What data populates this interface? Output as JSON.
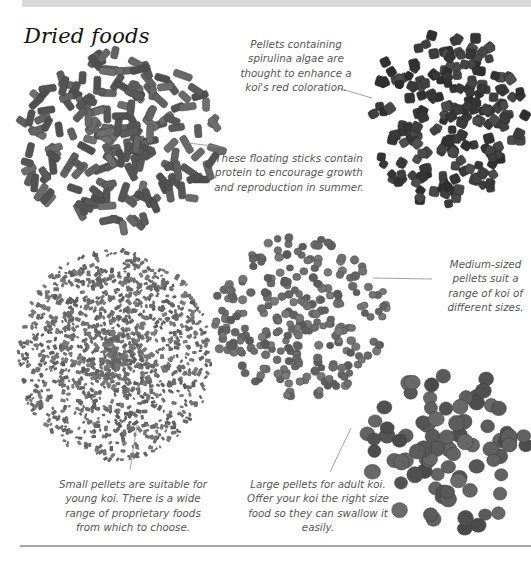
{
  "page": {
    "title": "Dried foods"
  },
  "captions": [
    {
      "id": "spirulina",
      "text": "Pellets containing spirulina algae are thought to enhance a koi's red coloration.",
      "x": 230,
      "y": 37,
      "w": 132
    },
    {
      "id": "sticks",
      "text": "These floating sticks contain protein to encourage growth and reproduction in summer.",
      "x": 214,
      "y": 151,
      "w": 150
    },
    {
      "id": "medium",
      "text": "Medium-sized pellets suit a range of koi of different sizes.",
      "x": 438,
      "y": 257,
      "w": 95
    },
    {
      "id": "small",
      "text": "Small pellets are suitable for young koi. There is a wide range of proprietary foods from which to choose.",
      "x": 54,
      "y": 477,
      "w": 158
    },
    {
      "id": "large",
      "text": "Large pellets for adult koi. Offer your koi the right size food so they can swallow it easily.",
      "x": 244,
      "y": 477,
      "w": 148
    }
  ],
  "piles": [
    {
      "id": "floating-sticks",
      "label": "Floating sticks",
      "shape": "stick",
      "cx": 118,
      "cy": 140,
      "rx": 100,
      "ry": 88,
      "count": 190,
      "size": 16,
      "thick": 7,
      "color": "#5f5f5f",
      "seed": 3
    },
    {
      "id": "spirulina-pellets",
      "label": "Spirulina pellets",
      "shape": "cube",
      "cx": 447,
      "cy": 118,
      "rx": 80,
      "ry": 88,
      "count": 210,
      "size": 9,
      "color": "#3e3e3e",
      "seed": 11
    },
    {
      "id": "medium-pellets",
      "label": "Medium pellets",
      "shape": "round",
      "cx": 300,
      "cy": 318,
      "rx": 88,
      "ry": 82,
      "count": 260,
      "size": 8,
      "color": "#6a6a6a",
      "seed": 21
    },
    {
      "id": "small-pellets",
      "label": "Small pellets",
      "shape": "tiny",
      "cx": 115,
      "cy": 355,
      "rx": 98,
      "ry": 105,
      "count": 1300,
      "size": 5,
      "color": "#6c6c6c",
      "seed": 41
    },
    {
      "id": "large-pellets",
      "label": "Large pellets",
      "shape": "disc",
      "cx": 447,
      "cy": 450,
      "rx": 82,
      "ry": 82,
      "count": 85,
      "size": 15,
      "color": "#5a5a5a",
      "seed": 57
    }
  ],
  "leaders": [
    {
      "from": [
        338,
        88
      ],
      "to": [
        372,
        98
      ]
    },
    {
      "from": [
        188,
        143
      ],
      "to": [
        222,
        147
      ]
    },
    {
      "from": [
        373,
        278
      ],
      "to": [
        432,
        279
      ]
    },
    {
      "from": [
        137,
        425
      ],
      "to": [
        130,
        470
      ]
    },
    {
      "from": [
        351,
        428
      ],
      "to": [
        330,
        472
      ]
    }
  ]
}
